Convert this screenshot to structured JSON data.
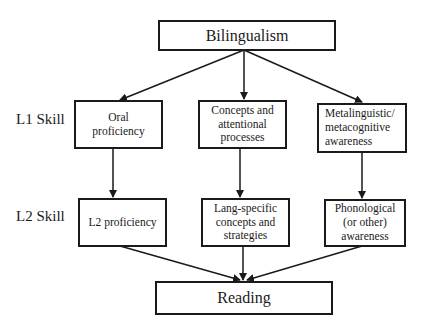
{
  "diagram": {
    "top": {
      "label": "Bilingualism"
    },
    "row_labels": {
      "l1": "L1 Skill",
      "l2": "L2 Skill"
    },
    "l1_nodes": [
      {
        "label": "Oral\nproficiency"
      },
      {
        "label": "Concepts and\nattentional\nprocesses"
      },
      {
        "label": "Metalinguistic/\nmetacognitive\nawareness"
      }
    ],
    "l2_nodes": [
      {
        "label": "L2 proficiency"
      },
      {
        "label": "Lang-specific\nconcepts and\nstrategies"
      },
      {
        "label": "Phonological\n(or other)\nawareness"
      }
    ],
    "bottom": {
      "label": "Reading"
    },
    "edges": [
      [
        "Bilingualism",
        "Oral proficiency"
      ],
      [
        "Bilingualism",
        "Concepts and attentional processes"
      ],
      [
        "Bilingualism",
        "Metalinguistic/metacognitive awareness"
      ],
      [
        "Oral proficiency",
        "L2 proficiency"
      ],
      [
        "Concepts and attentional processes",
        "Lang-specific concepts and strategies"
      ],
      [
        "Metalinguistic/metacognitive awareness",
        "Phonological (or other) awareness"
      ],
      [
        "L2 proficiency",
        "Reading"
      ],
      [
        "Lang-specific concepts and strategies",
        "Reading"
      ],
      [
        "Phonological (or other) awareness",
        "Reading"
      ]
    ]
  }
}
